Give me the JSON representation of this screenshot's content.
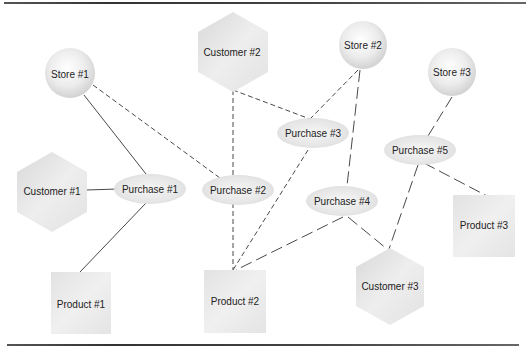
{
  "diagram": {
    "nodes": [
      {
        "id": "store1",
        "label": "Store #1",
        "type": "store",
        "shape": "sphere",
        "x": 70,
        "y": 73,
        "r": 23
      },
      {
        "id": "store2",
        "label": "Store #2",
        "type": "store",
        "shape": "sphere",
        "x": 363,
        "y": 45,
        "r": 23
      },
      {
        "id": "store3",
        "label": "Store #3",
        "type": "store",
        "shape": "sphere",
        "x": 452,
        "y": 72,
        "r": 23
      },
      {
        "id": "customer1",
        "label": "Customer #1",
        "type": "customer",
        "shape": "hexagon",
        "x": 52,
        "y": 191
      },
      {
        "id": "customer2",
        "label": "Customer #2",
        "type": "customer",
        "shape": "hexagon",
        "x": 232,
        "y": 52
      },
      {
        "id": "customer3",
        "label": "Customer #3",
        "type": "customer",
        "shape": "hexagon",
        "x": 390,
        "y": 286
      },
      {
        "id": "purchase1",
        "label": "Purchase #1",
        "type": "purchase",
        "shape": "ellipse",
        "x": 150,
        "y": 189
      },
      {
        "id": "purchase2",
        "label": "Purchase #2",
        "type": "purchase",
        "shape": "ellipse",
        "x": 238,
        "y": 190
      },
      {
        "id": "purchase3",
        "label": "Purchase #3",
        "type": "purchase",
        "shape": "ellipse",
        "x": 313,
        "y": 133
      },
      {
        "id": "purchase4",
        "label": "Purchase #4",
        "type": "purchase",
        "shape": "ellipse",
        "x": 342,
        "y": 201
      },
      {
        "id": "purchase5",
        "label": "Purchase #5",
        "type": "purchase",
        "shape": "ellipse",
        "x": 420,
        "y": 150
      },
      {
        "id": "product1",
        "label": "Product #1",
        "type": "product",
        "shape": "square",
        "x": 80,
        "y": 304
      },
      {
        "id": "product2",
        "label": "Product #2",
        "type": "product",
        "shape": "square",
        "x": 235,
        "y": 301
      },
      {
        "id": "product3",
        "label": "Product #3",
        "type": "product",
        "shape": "square",
        "x": 485,
        "y": 225
      }
    ],
    "edges": [
      {
        "from": "store1",
        "to": "purchase1",
        "style": "solid",
        "x1": 84,
        "y1": 95,
        "x2": 146,
        "y2": 174
      },
      {
        "from": "customer1",
        "to": "purchase1",
        "style": "solid",
        "x1": 86,
        "y1": 190,
        "x2": 118,
        "y2": 189
      },
      {
        "from": "purchase1",
        "to": "product1",
        "style": "solid",
        "x1": 146,
        "y1": 203,
        "x2": 80,
        "y2": 272
      },
      {
        "from": "store1",
        "to": "purchase2",
        "style": "dashed",
        "x1": 93,
        "y1": 85,
        "x2": 220,
        "y2": 178
      },
      {
        "from": "customer2",
        "to": "purchase2",
        "style": "dashed",
        "x1": 233,
        "y1": 90,
        "x2": 233,
        "y2": 178
      },
      {
        "from": "customer2",
        "to": "purchase3",
        "style": "dashed",
        "x1": 233,
        "y1": 90,
        "x2": 310,
        "y2": 119
      },
      {
        "from": "store2",
        "to": "purchase3",
        "style": "dashed",
        "x1": 358,
        "y1": 70,
        "x2": 310,
        "y2": 119
      },
      {
        "from": "purchase2",
        "to": "product2",
        "style": "dashed",
        "x1": 233,
        "y1": 203,
        "x2": 233,
        "y2": 270
      },
      {
        "from": "purchase3",
        "to": "product2",
        "style": "dashed",
        "x1": 308,
        "y1": 150,
        "x2": 233,
        "y2": 270
      },
      {
        "from": "store2",
        "to": "purchase4",
        "style": "dashed-long",
        "x1": 360,
        "y1": 70,
        "x2": 347,
        "y2": 186
      },
      {
        "from": "purchase4",
        "to": "product2",
        "style": "dashed-long",
        "x1": 343,
        "y1": 217,
        "x2": 236,
        "y2": 270
      },
      {
        "from": "purchase4",
        "to": "customer3",
        "style": "dashed-long",
        "x1": 348,
        "y1": 217,
        "x2": 387,
        "y2": 249
      },
      {
        "from": "store3",
        "to": "purchase5",
        "style": "dashed-long",
        "x1": 452,
        "y1": 97,
        "x2": 428,
        "y2": 136
      },
      {
        "from": "purchase5",
        "to": "customer3",
        "style": "dashed-long",
        "x1": 418,
        "y1": 165,
        "x2": 389,
        "y2": 249
      },
      {
        "from": "purchase5",
        "to": "product3",
        "style": "dashed-long",
        "x1": 424,
        "y1": 163,
        "x2": 487,
        "y2": 196
      }
    ]
  }
}
